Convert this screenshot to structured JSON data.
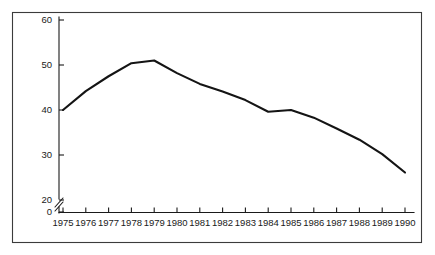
{
  "chart_data": {
    "type": "line",
    "title": "",
    "subtitle": "",
    "xlabel": "",
    "ylabel": "",
    "categories": [
      "1975",
      "1976",
      "1977",
      "1978",
      "1979",
      "1980",
      "1981",
      "1982",
      "1983",
      "1984",
      "1985",
      "1986",
      "1987",
      "1988",
      "1989",
      "1990"
    ],
    "x": [
      1975,
      1976,
      1977,
      1978,
      1979,
      1980,
      1981,
      1982,
      1983,
      1984,
      1985,
      1986,
      1987,
      1988,
      1989,
      1990
    ],
    "values": [
      40.0,
      44.2,
      47.5,
      50.4,
      51.0,
      48.2,
      45.8,
      44.1,
      42.2,
      39.6,
      40.0,
      38.3,
      35.9,
      33.4,
      30.2,
      26.1
    ],
    "series": [
      {
        "name": "series-1",
        "values": [
          40.0,
          44.2,
          47.5,
          50.4,
          51.0,
          48.2,
          45.8,
          44.1,
          42.2,
          39.6,
          40.0,
          38.3,
          35.9,
          33.4,
          30.2,
          26.1
        ],
        "color": "#141414"
      }
    ],
    "ylim": [
      0,
      60
    ],
    "xlim": [
      1975,
      1990
    ],
    "y_tick_labels": [
      "0",
      "20",
      "30",
      "40",
      "50",
      "60"
    ],
    "y_tick_values": [
      0,
      20,
      30,
      40,
      50,
      60
    ],
    "x_tick_labels": [
      "1975",
      "1976",
      "1977",
      "1978",
      "1979",
      "1980",
      "1981",
      "1982",
      "1983",
      "1984",
      "1985",
      "1986",
      "1987",
      "1988",
      "1989",
      "1990"
    ],
    "axis_break": true,
    "axis_break_between": [
      0,
      20
    ],
    "grid": false,
    "legend": null,
    "legend_position": "none",
    "annotations": [],
    "frame_color": "#3b3b3b",
    "axis_color": "#1a1a1a",
    "line_color": "#141414",
    "background_color": "#ffffff"
  }
}
